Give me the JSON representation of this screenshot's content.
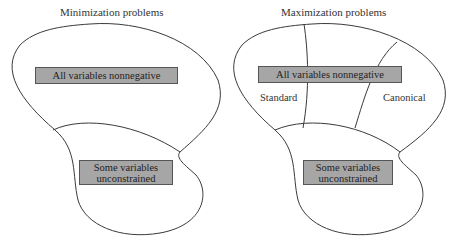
{
  "left": {
    "title": "Minimization problems",
    "box_top": "All variables nonnegative",
    "box_bottom": "Some variables unconstrained"
  },
  "right": {
    "title": "Maximization problems",
    "box_top": "All variables nonnegative",
    "box_bottom": "Some variables unconstrained",
    "region_left": "Standard",
    "region_right": "Canonical"
  },
  "colors": {
    "box_fill": "#a6a6a6",
    "outline": "#3a3a3a"
  }
}
